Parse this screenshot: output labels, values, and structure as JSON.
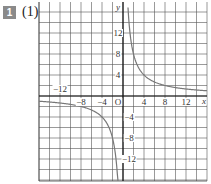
{
  "problem": {
    "badge": "1",
    "part": "(1)"
  },
  "chart_data": {
    "type": "line",
    "title": "",
    "function": "y = 16/x",
    "xlabel": "x",
    "ylabel": "y",
    "origin_label": "O",
    "xlim": [
      -16,
      16
    ],
    "ylim": [
      -16,
      16
    ],
    "grid": true,
    "grid_step": 2,
    "x_ticks": [
      {
        "value": -12,
        "label": "−12"
      },
      {
        "value": -8,
        "label": "−8"
      },
      {
        "value": -4,
        "label": "−4"
      },
      {
        "value": 4,
        "label": "4"
      },
      {
        "value": 8,
        "label": "8"
      },
      {
        "value": 12,
        "label": "12"
      }
    ],
    "y_ticks": [
      {
        "value": 12,
        "label": "12"
      },
      {
        "value": 8,
        "label": "8"
      },
      {
        "value": 4,
        "label": "4"
      },
      {
        "value": -4,
        "label": "−4"
      },
      {
        "value": -8,
        "label": "−8"
      },
      {
        "value": -12,
        "label": "−12"
      }
    ],
    "series": [
      {
        "name": "branch-positive",
        "points": [
          [
            1,
            16
          ],
          [
            2,
            8
          ],
          [
            4,
            4
          ],
          [
            8,
            2
          ],
          [
            16,
            1
          ]
        ]
      },
      {
        "name": "branch-negative",
        "points": [
          [
            -16,
            -1
          ],
          [
            -8,
            -2
          ],
          [
            -4,
            -4
          ],
          [
            -2,
            -8
          ],
          [
            -1,
            -16
          ]
        ]
      }
    ]
  }
}
